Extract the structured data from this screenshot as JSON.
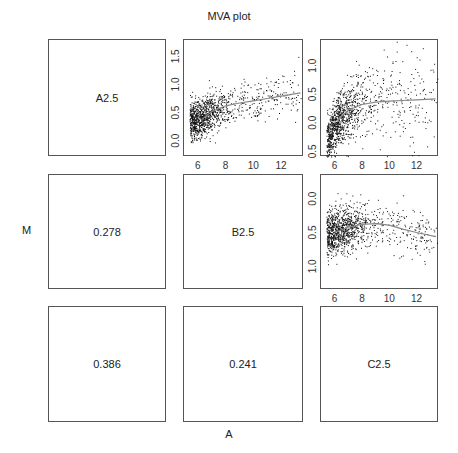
{
  "chart_data": {
    "type": "scatter",
    "title": "MVA plot",
    "xlabel": "A",
    "ylabel": "M",
    "layout": "3x3 pairs matrix",
    "diagonal_labels": [
      "A2.5",
      "B2.5",
      "C2.5"
    ],
    "lower_correlations": [
      {
        "row": 2,
        "col": 1,
        "value": "0.278"
      },
      {
        "row": 3,
        "col": 1,
        "value": "0.386"
      },
      {
        "row": 3,
        "col": 2,
        "value": "0.241"
      }
    ],
    "upper_panels": [
      {
        "name": "A2.5 vs B2.5",
        "row": 1,
        "col": 2,
        "xlim": [
          5.0,
          13.65
        ],
        "ylim": [
          -0.29,
          1.79
        ],
        "x_ticks": [
          "6",
          "8",
          "10",
          "12"
        ],
        "y_ticks": [
          "0.0",
          "0.5",
          "1.0",
          "1.5"
        ],
        "y_tick_values": [
          0.0,
          0.5,
          1.0,
          1.5
        ],
        "loess_line": [
          [
            6.3,
            0.38
          ],
          [
            7,
            0.52
          ],
          [
            8,
            0.62
          ],
          [
            9,
            0.67
          ],
          [
            10,
            0.71
          ],
          [
            11,
            0.75
          ],
          [
            12,
            0.79
          ],
          [
            13.4,
            0.85
          ]
        ],
        "n_points": 1100
      },
      {
        "name": "A2.5 vs C2.5",
        "row": 1,
        "col": 3,
        "xlim": [
          5.0,
          13.65
        ],
        "ylim": [
          -0.6,
          1.45
        ],
        "x_ticks": [
          "6",
          "8",
          "10",
          "12"
        ],
        "y_ticks": [
          "0.5",
          "0.0",
          "0.5",
          "1.0"
        ],
        "y_tick_values": [
          -0.5,
          0.0,
          0.5,
          1.0
        ],
        "loess_line": [
          [
            6.2,
            0.05
          ],
          [
            7,
            0.22
          ],
          [
            8,
            0.32
          ],
          [
            9,
            0.36
          ],
          [
            10,
            0.38
          ],
          [
            11,
            0.39
          ],
          [
            12,
            0.4
          ],
          [
            13.4,
            0.42
          ]
        ],
        "n_points": 1100
      },
      {
        "name": "B2.5 vs C2.5",
        "row": 2,
        "col": 3,
        "xlim": [
          5.0,
          13.65
        ],
        "ylim": [
          -0.35,
          1.35
        ],
        "y_axis_inverted": true,
        "x_ticks": [
          "6",
          "8",
          "10",
          "12"
        ],
        "y_ticks": [
          "0.0",
          "0.5",
          "1.0"
        ],
        "y_tick_values": [
          0.0,
          0.5,
          1.0
        ],
        "loess_line": [
          [
            6.0,
            0.5
          ],
          [
            7,
            0.42
          ],
          [
            8,
            0.38
          ],
          [
            9,
            0.37
          ],
          [
            10,
            0.39
          ],
          [
            11,
            0.45
          ],
          [
            12,
            0.5
          ],
          [
            13.4,
            0.56
          ]
        ],
        "n_points": 1100
      }
    ],
    "grid": false,
    "legend": "none"
  },
  "labels": {
    "title": "MVA plot",
    "ylabel": "M",
    "xlabel": "A",
    "diag_1": "A2.5",
    "diag_2": "B2.5",
    "diag_3": "C2.5",
    "corr_2_1": "0.278",
    "corr_3_1": "0.386",
    "corr_3_2": "0.241"
  }
}
